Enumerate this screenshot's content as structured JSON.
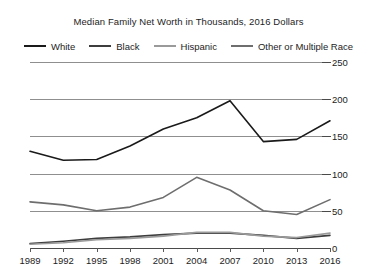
{
  "chart_data": {
    "type": "line",
    "title": "Median Family Net Worth in Thousands, 2016 Dollars",
    "xlabel": "",
    "ylabel": "",
    "x": [
      1989,
      1992,
      1995,
      1998,
      2001,
      2004,
      2007,
      2010,
      2013,
      2016
    ],
    "xtick_labels": [
      "1989",
      "1992",
      "1995",
      "1998",
      "2001",
      "2004",
      "2007",
      "2010",
      "2013",
      "2016"
    ],
    "ytick_labels": [
      "0",
      "50",
      "100",
      "150",
      "200",
      "250"
    ],
    "yticks": [
      0,
      50,
      100,
      150,
      200,
      250
    ],
    "ylim": [
      0,
      250
    ],
    "grid": true,
    "legend_position": "top",
    "series": [
      {
        "name": "White",
        "color": "#1a1a1a",
        "values": [
          130,
          118,
          119,
          137,
          160,
          175,
          198,
          143,
          146,
          171
        ]
      },
      {
        "name": "Black",
        "color": "#3d3d3d",
        "values": [
          6,
          9,
          13,
          15,
          18,
          20,
          20,
          17,
          13,
          17
        ]
      },
      {
        "name": "Hispanic",
        "color": "#9a9a9a",
        "values": [
          5,
          7,
          11,
          13,
          16,
          21,
          21,
          16,
          14,
          20
        ]
      },
      {
        "name": "Other or Multiple Race",
        "color": "#6e6e6e",
        "values": [
          62,
          58,
          50,
          55,
          68,
          95,
          78,
          50,
          45,
          65
        ]
      }
    ]
  }
}
